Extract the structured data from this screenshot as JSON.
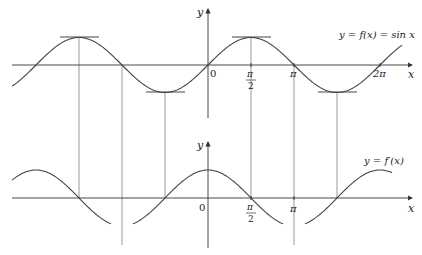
{
  "figure": {
    "top_graph": {
      "function_label": "y = f(x) = sin x",
      "y_axis_label": "y",
      "x_axis_label": "x",
      "origin_label": "0",
      "tick_labels": {
        "half_pi_num": "π",
        "half_pi_den": "2",
        "pi": "π",
        "two_pi": "2π"
      },
      "horizontal_tangents_at": [
        "-3π/2",
        "-π/2",
        "π/2",
        "3π/2"
      ]
    },
    "bottom_graph": {
      "function_label": "y = f′(x)",
      "y_axis_label": "y",
      "x_axis_label": "x",
      "origin_label": "0",
      "tick_labels": {
        "half_pi_num": "π",
        "half_pi_den": "2",
        "pi": "π"
      }
    },
    "colors": {
      "line": "#444444",
      "background": "#ffffff"
    }
  }
}
